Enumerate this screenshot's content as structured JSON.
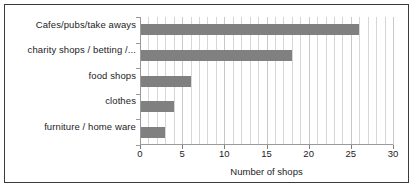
{
  "chart_data": {
    "type": "bar",
    "orientation": "horizontal",
    "title": "",
    "xlabel": "Number of shops",
    "ylabel": "",
    "categories": [
      "Cafes/pubs/take aways",
      "charity shops / betting /...",
      "food shops",
      "clothes",
      "furniture / home ware"
    ],
    "values": [
      26,
      18,
      6,
      4,
      3
    ],
    "xlim": [
      0,
      30
    ],
    "xticks": [
      0,
      5,
      10,
      15,
      20,
      25,
      30
    ],
    "xtick_labels": [
      "0",
      "5",
      "10",
      "15",
      "20",
      "25",
      "30"
    ],
    "minor_gridline_step": 1,
    "grid": true,
    "legend": false,
    "bar_color": "#808080",
    "gridline_color": "#d6d6d6",
    "axis_color": "#9a9a9a",
    "text_color": "#1c1c1c",
    "border_color": "#3a3a3a",
    "background": "#ffffff"
  }
}
